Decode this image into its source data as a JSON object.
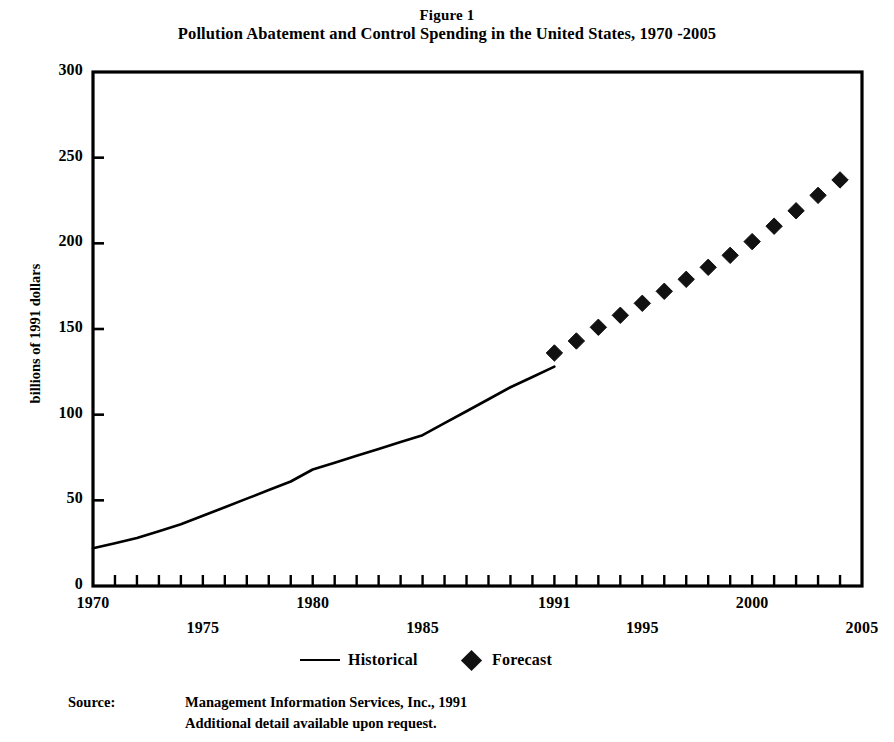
{
  "figure": {
    "title_line1": "Figure 1",
    "title_line2": "Pollution Abatement and Control Spending in the United States, 1970 -2005"
  },
  "legend": {
    "historical_label": "Historical",
    "forecast_label": "Forecast"
  },
  "source": {
    "label": "Source:",
    "line1": "Management Information Services, Inc., 1991",
    "line2": "Additional detail available upon request."
  },
  "chart_data": {
    "type": "line",
    "title": "Pollution Abatement and Control Spending in the United States, 1970 -2005",
    "subtitle": "Figure 1",
    "xlabel": "",
    "ylabel": "billions of 1991 dollars",
    "xlim": [
      1970,
      2005
    ],
    "ylim": [
      0,
      300
    ],
    "grid": false,
    "legend_position": "bottom-center",
    "yticks": [
      0,
      50,
      100,
      150,
      200,
      250,
      300
    ],
    "ytick_labels": [
      "0",
      "50",
      "100",
      "150",
      "200",
      "250",
      "300"
    ],
    "xticks": [
      1970,
      1975,
      1980,
      1985,
      1991,
      1995,
      2000,
      2005
    ],
    "xtick_labels": [
      "1970",
      "1975",
      "1980",
      "1985",
      "1991",
      "1995",
      "2000",
      "2005"
    ],
    "xtick_minor_interval": 1,
    "series": [
      {
        "name": "Historical",
        "style": "line",
        "color": "#000000",
        "x": [
          1970,
          1971,
          1972,
          1973,
          1974,
          1975,
          1976,
          1977,
          1978,
          1979,
          1980,
          1981,
          1982,
          1983,
          1984,
          1985,
          1986,
          1987,
          1988,
          1989,
          1990,
          1991
        ],
        "values": [
          22,
          25,
          28,
          32,
          36,
          41,
          46,
          51,
          56,
          61,
          68,
          72,
          76,
          80,
          84,
          88,
          95,
          102,
          109,
          116,
          122,
          128
        ]
      },
      {
        "name": "Forecast",
        "style": "diamond-markers",
        "color": "#111111",
        "x": [
          1991,
          1992,
          1993,
          1994,
          1995,
          1996,
          1997,
          1998,
          1999,
          2000,
          2001,
          2002,
          2003,
          2004,
          2005
        ],
        "values": [
          136,
          143,
          151,
          158,
          165,
          172,
          179,
          186,
          193,
          201,
          210,
          219,
          228,
          237,
          237
        ]
      }
    ]
  }
}
